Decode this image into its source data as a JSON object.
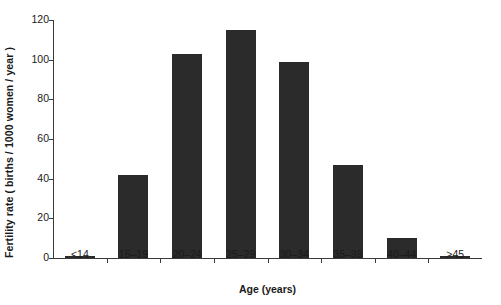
{
  "chart_data": {
    "type": "bar",
    "title": "",
    "xlabel": "Age (years)",
    "ylabel": "Fertility rate ( births / 1000 women / year )",
    "categories": [
      "<14",
      "15–19",
      "20–24",
      "25–29",
      "30–34",
      "35–39",
      "40–44",
      ">45"
    ],
    "values": [
      0.8,
      42,
      103,
      115,
      99,
      47,
      10,
      0.8
    ],
    "series": [
      {
        "name": "Fertility rate",
        "values": [
          0.8,
          42,
          103,
          115,
          99,
          47,
          10,
          0.8
        ]
      }
    ],
    "ylim": [
      0,
      120
    ],
    "yticks": [
      0,
      20,
      40,
      60,
      80,
      100,
      120
    ],
    "ytick_labels": [
      "0",
      "20",
      "40",
      "60",
      "80",
      "100",
      "120"
    ],
    "grid": false,
    "legend": null,
    "bar_color": "#2b2b2b",
    "axis_color": "#3a3a3a",
    "background": "#ffffff"
  }
}
